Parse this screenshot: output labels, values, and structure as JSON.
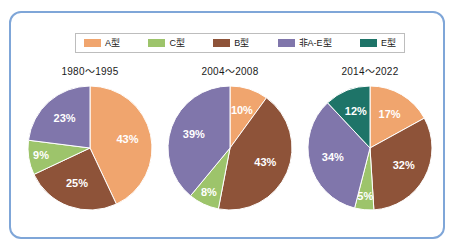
{
  "panel": {
    "border_color": "#7fa6d8",
    "background": "#ffffff"
  },
  "legend": {
    "items": [
      {
        "label": "A型",
        "color": "#f0a56e"
      },
      {
        "label": "C型",
        "color": "#9dc46b"
      },
      {
        "label": "B型",
        "color": "#8e5339"
      },
      {
        "label": "非A-E型",
        "color": "#8076ab"
      },
      {
        "label": "E型",
        "color": "#1e7468"
      }
    ]
  },
  "chart_data": [
    {
      "type": "pie",
      "title": "1980～1995",
      "labels": [
        "A型",
        "B型",
        "C型",
        "非A-E型"
      ],
      "values": [
        43,
        25,
        9,
        23
      ],
      "value_labels": [
        "43%",
        "25%",
        "9%",
        "23%"
      ],
      "colors": [
        "#f0a56e",
        "#8e5339",
        "#9dc46b",
        "#8076ab"
      ],
      "start_angle": 0,
      "legend_position": "top",
      "grid": false
    },
    {
      "type": "pie",
      "title": "2004～2008",
      "labels": [
        "A型",
        "B型",
        "C型",
        "非A-E型"
      ],
      "values": [
        10,
        43,
        8,
        39
      ],
      "value_labels": [
        "10%",
        "43%",
        "8%",
        "39%"
      ],
      "colors": [
        "#f0a56e",
        "#8e5339",
        "#9dc46b",
        "#8076ab"
      ],
      "start_angle": 0,
      "legend_position": "top",
      "grid": false
    },
    {
      "type": "pie",
      "title": "2014～2022",
      "labels": [
        "A型",
        "B型",
        "C型",
        "非A-E型",
        "E型"
      ],
      "values": [
        17,
        32,
        5,
        34,
        12
      ],
      "value_labels": [
        "17%",
        "32%",
        "5%",
        "34%",
        "12%"
      ],
      "colors": [
        "#f0a56e",
        "#8e5339",
        "#9dc46b",
        "#8076ab",
        "#1e7468"
      ],
      "start_angle": 0,
      "legend_position": "top",
      "grid": false
    }
  ]
}
